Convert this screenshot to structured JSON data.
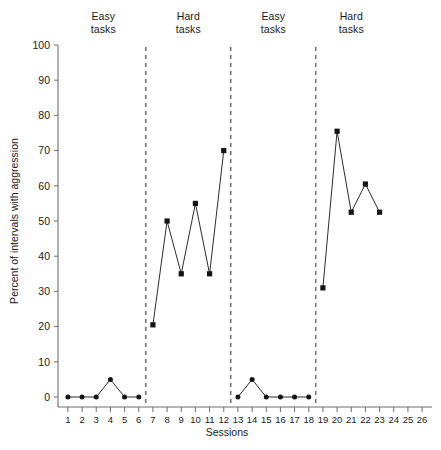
{
  "chart_data": {
    "type": "line",
    "title": "",
    "xlabel": "Sessions",
    "ylabel": "Percent of intervals with aggression",
    "xlim": [
      0.3,
      26.7
    ],
    "ylim": [
      0,
      100
    ],
    "yticks": [
      0,
      10,
      20,
      30,
      40,
      50,
      60,
      70,
      80,
      90,
      100
    ],
    "xticks": [
      1,
      2,
      3,
      4,
      5,
      6,
      7,
      8,
      9,
      10,
      11,
      12,
      13,
      14,
      15,
      16,
      17,
      18,
      19,
      20,
      21,
      22,
      23,
      24,
      25,
      26
    ],
    "grid": false,
    "legend": "none",
    "phases": [
      {
        "label": "Easy\ntasks",
        "condition": "Easy tasks",
        "marker": "circle",
        "sessions": [
          1,
          2,
          3,
          4,
          5,
          6
        ],
        "values": [
          0,
          0,
          0,
          5,
          0,
          0
        ]
      },
      {
        "label": "Hard\ntasks",
        "condition": "Hard tasks",
        "marker": "square",
        "sessions": [
          7,
          8,
          9,
          10,
          11,
          12
        ],
        "values": [
          20.5,
          50,
          35,
          55,
          35,
          70
        ]
      },
      {
        "label": "Easy\ntasks",
        "condition": "Easy tasks",
        "marker": "circle",
        "sessions": [
          13,
          14,
          15,
          16,
          17,
          18
        ],
        "values": [
          0,
          5,
          0,
          0,
          0,
          0
        ]
      },
      {
        "label": "Hard\ntasks",
        "condition": "Hard tasks",
        "marker": "square",
        "sessions": [
          19,
          20,
          21,
          22,
          23
        ],
        "values": [
          31,
          75.5,
          52.5,
          60.5,
          52.5
        ]
      }
    ],
    "phase_dividers": [
      6.5,
      12.5,
      18.5
    ],
    "colors": {
      "line": "#2b2b2b",
      "marker": "#141414",
      "axis": "#6f6f6f",
      "divider": "#2b2b2b",
      "background": "#ffffff"
    }
  }
}
